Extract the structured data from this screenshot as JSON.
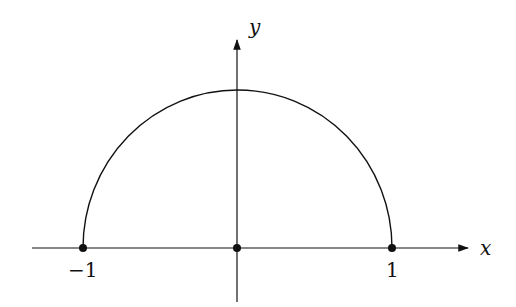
{
  "diagram": {
    "axes": {
      "x_label": "x",
      "y_label": "y"
    },
    "tick_labels": {
      "left": "−1",
      "right": "1"
    },
    "points": [
      {
        "name": "left-endpoint",
        "x": -1,
        "y": 0
      },
      {
        "name": "origin",
        "x": 0,
        "y": 0
      },
      {
        "name": "right-endpoint",
        "x": 1,
        "y": 0
      }
    ],
    "curve": "upper half of unit circle",
    "colors": {
      "stroke": "#111111",
      "background": "#ffffff"
    }
  }
}
